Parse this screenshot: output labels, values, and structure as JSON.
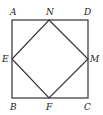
{
  "diagram": {
    "points": {
      "A": {
        "label": "A",
        "x": 12,
        "y": 20
      },
      "D": {
        "label": "D",
        "x": 88,
        "y": 20
      },
      "B": {
        "label": "B",
        "x": 12,
        "y": 98
      },
      "C": {
        "label": "C",
        "x": 88,
        "y": 98
      },
      "N": {
        "label": "N",
        "x": 49,
        "y": 20
      },
      "E": {
        "label": "E",
        "x": 12,
        "y": 59
      },
      "M": {
        "label": "M",
        "x": 88,
        "y": 59
      },
      "F": {
        "label": "F",
        "x": 49,
        "y": 98
      }
    },
    "segments": [
      "AD",
      "DC",
      "CB",
      "BA",
      "EN",
      "NM",
      "MF",
      "FE"
    ],
    "stroke_color": "#333333"
  }
}
